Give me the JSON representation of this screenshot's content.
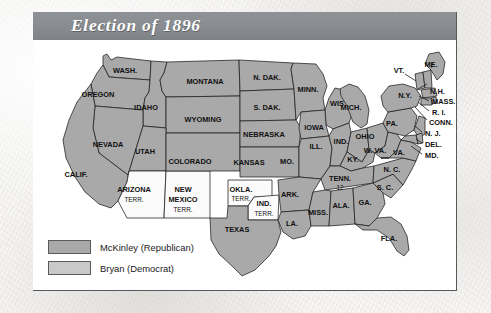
{
  "figure": {
    "title": "Election of 1896"
  },
  "legend": {
    "items": [
      {
        "label": "McKinley (Republican)",
        "color": "#a9a9a9",
        "swatch_name": "legend-swatch-mckinley"
      },
      {
        "label": "Bryan (Democrat)",
        "color": "#c9c9c9",
        "swatch_name": "legend-swatch-bryan"
      }
    ]
  },
  "map": {
    "colors": {
      "mckinley": "#a9a9a9",
      "bryan": "#c0c0c0",
      "territory": "#fbfbfb",
      "border": "#1d1d1d"
    },
    "states": [
      {
        "id": "WA",
        "label": "WASH.",
        "fill": "#a9a9a9",
        "lx": 92,
        "ly": 31
      },
      {
        "id": "OR",
        "label": "OREGON",
        "fill": "#a9a9a9",
        "lx": 65,
        "ly": 55
      },
      {
        "id": "ID",
        "label": "IDAHO",
        "fill": "#a9a9a9",
        "lx": 113,
        "ly": 68
      },
      {
        "id": "MT",
        "label": "MONTANA",
        "fill": "#a9a9a9",
        "lx": 172,
        "ly": 42
      },
      {
        "id": "ND",
        "label": "N. DAK.",
        "fill": "#a9a9a9",
        "lx": 234,
        "ly": 38
      },
      {
        "id": "SD",
        "label": "S. DAK.",
        "fill": "#a9a9a9",
        "lx": 234,
        "ly": 68
      },
      {
        "id": "MN",
        "label": "MINN.",
        "fill": "#a9a9a9",
        "lx": 275,
        "ly": 50
      },
      {
        "id": "WI",
        "label": "WIS.",
        "fill": "#a9a9a9",
        "lx": 305,
        "ly": 64
      },
      {
        "id": "WY",
        "label": "WYOMING",
        "fill": "#a9a9a9",
        "lx": 170,
        "ly": 80
      },
      {
        "id": "NE",
        "label": "NEBRASKA",
        "fill": "#a9a9a9",
        "lx": 231,
        "ly": 95
      },
      {
        "id": "IA",
        "label": "IOWA",
        "fill": "#a9a9a9",
        "lx": 281,
        "ly": 88
      },
      {
        "id": "NV",
        "label": "NEVADA",
        "fill": "#a9a9a9",
        "lx": 75,
        "ly": 105
      },
      {
        "id": "UT",
        "label": "UTAH",
        "fill": "#a9a9a9",
        "lx": 112,
        "ly": 112
      },
      {
        "id": "CO",
        "label": "COLORADO",
        "fill": "#a9a9a9",
        "lx": 157,
        "ly": 122
      },
      {
        "id": "KS",
        "label": "KANSAS",
        "fill": "#a9a9a9",
        "lx": 216,
        "ly": 123
      },
      {
        "id": "MO",
        "label": "MO.",
        "fill": "#a9a9a9",
        "lx": 254,
        "ly": 122
      },
      {
        "id": "IL",
        "label": "ILL.",
        "fill": "#a9a9a9",
        "lx": 283,
        "ly": 107
      },
      {
        "id": "IN",
        "label": "IND.",
        "fill": "#a9a9a9",
        "lx": 308,
        "ly": 102
      },
      {
        "id": "MI",
        "label": "MICH.",
        "fill": "#a9a9a9",
        "lx": 318,
        "ly": 68
      },
      {
        "id": "OH",
        "label": "OHIO",
        "fill": "#a9a9a9",
        "lx": 332,
        "ly": 97
      },
      {
        "id": "CA",
        "label": "CALIF.",
        "fill": "#a9a9a9",
        "lx": 43,
        "ly": 135
      },
      {
        "id": "AZ",
        "label": "ARIZONA",
        "fill": "#fbfbfb",
        "lx": 101,
        "ly": 150,
        "sub": "TERR.",
        "sy": 160
      },
      {
        "id": "NM",
        "label": "NEW",
        "fill": "#fbfbfb",
        "lx": 150,
        "ly": 150,
        "sub": "MEXICO",
        "sy": 160,
        "sub2": "TERR.",
        "s2y": 170
      },
      {
        "id": "OK",
        "label": "OKLA.",
        "fill": "#fbfbfb",
        "lx": 208,
        "ly": 150,
        "sub": "TERR.",
        "sy": 159
      },
      {
        "id": "IT",
        "label": "IND.",
        "fill": "#fbfbfb",
        "lx": 231,
        "ly": 164,
        "sub": "TERR.",
        "sy": 174
      },
      {
        "id": "TX",
        "label": "TEXAS",
        "fill": "#a9a9a9",
        "lx": 204,
        "ly": 190
      },
      {
        "id": "AR",
        "label": "ARK.",
        "fill": "#a9a9a9",
        "lx": 257,
        "ly": 155
      },
      {
        "id": "LA",
        "label": "LA.",
        "fill": "#a9a9a9",
        "lx": 259,
        "ly": 184
      },
      {
        "id": "MS",
        "label": "MISS.",
        "fill": "#a9a9a9",
        "lx": 285,
        "ly": 173
      },
      {
        "id": "AL",
        "label": "ALA.",
        "fill": "#a9a9a9",
        "lx": 308,
        "ly": 166
      },
      {
        "id": "TN",
        "label": "TENN.",
        "fill": "#a9a9a9",
        "lx": 307,
        "ly": 139,
        "sub": "12",
        "sy": 148
      },
      {
        "id": "KY",
        "label": "KY.",
        "fill": "#a9a9a9",
        "lx": 320,
        "ly": 120
      },
      {
        "id": "GA",
        "label": "GA.",
        "fill": "#a9a9a9",
        "lx": 332,
        "ly": 163
      },
      {
        "id": "FL",
        "label": "FLA.",
        "fill": "#a9a9a9",
        "lx": 356,
        "ly": 199
      },
      {
        "id": "SC",
        "label": "S. C.",
        "fill": "#a9a9a9",
        "lx": 352,
        "ly": 148
      },
      {
        "id": "NC",
        "label": "N. C.",
        "fill": "#a9a9a9",
        "lx": 359,
        "ly": 130
      },
      {
        "id": "WV",
        "label": "W. VA.",
        "fill": "#a9a9a9",
        "lx": 342,
        "ly": 111
      },
      {
        "id": "VA",
        "label": "VA.",
        "fill": "#a9a9a9",
        "lx": 366,
        "ly": 113
      },
      {
        "id": "PA",
        "label": "PA.",
        "fill": "#a9a9a9",
        "lx": 359,
        "ly": 84
      },
      {
        "id": "NY",
        "label": "N.Y.",
        "fill": "#a9a9a9",
        "lx": 372,
        "ly": 56
      }
    ],
    "callouts": [
      {
        "id": "ME",
        "label": "ME.",
        "lx": 398,
        "ly": 25
      },
      {
        "id": "VT",
        "label": "VT.",
        "lx": 366,
        "ly": 31
      },
      {
        "id": "NH",
        "label": "N.H.",
        "lx": 399,
        "ly": 52
      },
      {
        "id": "MA",
        "label": "MASS.",
        "lx": 401,
        "ly": 62
      },
      {
        "id": "RI",
        "label": "R. I.",
        "lx": 401,
        "ly": 73
      },
      {
        "id": "CT",
        "label": "CONN.",
        "lx": 398,
        "ly": 83
      },
      {
        "id": "NJ",
        "label": "N. J.",
        "lx": 394,
        "ly": 94
      },
      {
        "id": "DE",
        "label": "DEL.",
        "lx": 394,
        "ly": 105
      },
      {
        "id": "MD",
        "label": "MD.",
        "lx": 394,
        "ly": 116
      }
    ]
  }
}
